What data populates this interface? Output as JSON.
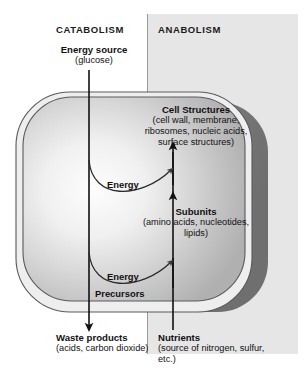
{
  "diagram": {
    "title_left": "CATABOLISM",
    "title_right": "ANABOLISM",
    "colors": {
      "panel_right_bg": "#e6e6e6",
      "panel_left_bg": "#ffffff",
      "divider": "#9a9a9a",
      "cell_shadow": "#7c7c7c",
      "cell_outline": "#555555",
      "text": "#111111",
      "arrow": "#111111"
    },
    "inputs": {
      "energy_source_title": "Energy source",
      "energy_source_detail": "(glucose)"
    },
    "products": {
      "cell_structures_title": "Cell Structures",
      "cell_structures_detail": "(cell wall, membrane, ribosomes, nucleic acids, surface structures)",
      "subunits_title": "Subunits",
      "subunits_detail": "(amino acids, nucleotides, lipids)"
    },
    "flows": {
      "energy_upper": "Energy",
      "energy_lower": "Energy",
      "precursors": "Precursors"
    },
    "outputs": {
      "waste_title": "Waste products",
      "waste_detail": "(acids, carbon dioxide)",
      "nutrients_title": "Nutrients",
      "nutrients_detail": "(source of nitrogen, sulfur, etc.)"
    }
  }
}
